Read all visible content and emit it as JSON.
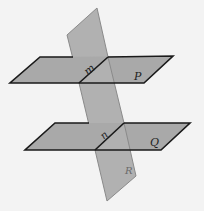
{
  "diagram": {
    "type": "intersecting-planes",
    "planes": [
      {
        "name": "P",
        "label": "P",
        "orientation": "horizontal",
        "position": "upper"
      },
      {
        "name": "Q",
        "label": "Q",
        "orientation": "horizontal",
        "position": "lower"
      },
      {
        "name": "R",
        "label": "R",
        "orientation": "vertical",
        "position": "crossing both"
      }
    ],
    "lines": [
      {
        "name": "m",
        "label": "m",
        "intersection_of": [
          "P",
          "R"
        ]
      },
      {
        "name": "n",
        "label": "n",
        "intersection_of": [
          "Q",
          "R"
        ]
      }
    ],
    "colors": {
      "background": "#f3f3f3",
      "plane_fill": "#a9a9a9",
      "vertical_plane_fill": "#b1b1b1",
      "edge": "#1a1a1a",
      "vertical_plane_edge": "#8a8a8a"
    }
  }
}
